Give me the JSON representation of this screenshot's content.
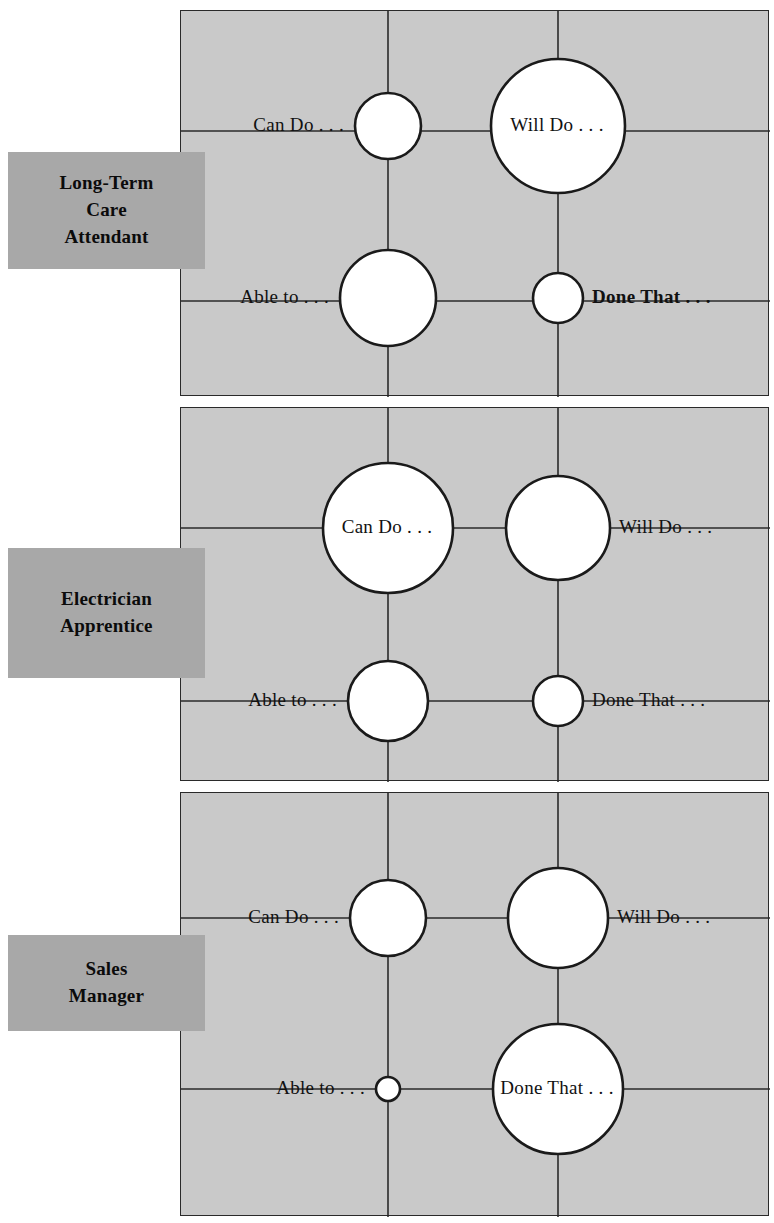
{
  "figure": {
    "type": "bubble-quadrant-grid",
    "background_color": "#ffffff",
    "panel_fill": "#c9c9c9",
    "panel_stroke": "#2a2a2a",
    "bubble_fill": "#ffffff",
    "bubble_stroke": "#1a1a1a",
    "role_box_fill": "#a8a8a8",
    "quadrant_labels": [
      "Can Do . . .",
      "Will Do . . .",
      "Able to . . .",
      "Done That . . ."
    ]
  },
  "panels": [
    {
      "role_label": "Long-Term\nCare\nAttendant",
      "role_box": {
        "x": 8,
        "y": 152,
        "w": 197,
        "h": 117
      },
      "frame": {
        "x": 180,
        "y": 10,
        "w": 589,
        "h": 386
      },
      "grid": {
        "vx": [
          387,
          557
        ],
        "hy": [
          130,
          300
        ]
      },
      "bubbles": [
        {
          "name": "can-do",
          "label": "Can Do . . .",
          "cx": 387,
          "cy": 125,
          "r": 33,
          "label_pos": "left",
          "label_inside": false,
          "bold": false
        },
        {
          "name": "will-do",
          "label": "Will Do . . .",
          "cx": 557,
          "cy": 125,
          "r": 67,
          "label_pos": "center",
          "label_inside": true,
          "bold": false
        },
        {
          "name": "able-to",
          "label": "Able to . . .",
          "cx": 387,
          "cy": 297,
          "r": 48,
          "label_pos": "left",
          "label_inside": false,
          "bold": false
        },
        {
          "name": "done-that",
          "label": "Done That . . .",
          "cx": 557,
          "cy": 297,
          "r": 25,
          "label_pos": "right",
          "label_inside": false,
          "bold": true
        }
      ]
    },
    {
      "role_label": "Electrician\nApprentice",
      "role_box": {
        "x": 8,
        "y": 548,
        "w": 197,
        "h": 130
      },
      "frame": {
        "x": 180,
        "y": 407,
        "w": 589,
        "h": 374
      },
      "grid": {
        "vx": [
          387,
          557
        ],
        "hy": [
          527,
          700
        ]
      },
      "bubbles": [
        {
          "name": "can-do",
          "label": "Can Do . . .",
          "cx": 387,
          "cy": 527,
          "r": 65,
          "label_pos": "center",
          "label_inside": true,
          "bold": false
        },
        {
          "name": "will-do",
          "label": "Will Do . . .",
          "cx": 557,
          "cy": 527,
          "r": 52,
          "label_pos": "right",
          "label_inside": false,
          "bold": false
        },
        {
          "name": "able-to",
          "label": "Able to . . .",
          "cx": 387,
          "cy": 700,
          "r": 40,
          "label_pos": "left",
          "label_inside": false,
          "bold": false
        },
        {
          "name": "done-that",
          "label": "Done That . . .",
          "cx": 557,
          "cy": 700,
          "r": 25,
          "label_pos": "right",
          "label_inside": false,
          "bold": false
        }
      ]
    },
    {
      "role_label": "Sales\nManager",
      "role_box": {
        "x": 8,
        "y": 935,
        "w": 197,
        "h": 96
      },
      "frame": {
        "x": 180,
        "y": 792,
        "w": 589,
        "h": 424
      },
      "grid": {
        "vx": [
          387,
          557
        ],
        "hy": [
          917,
          1088
        ]
      },
      "bubbles": [
        {
          "name": "can-do",
          "label": "Can Do . . .",
          "cx": 387,
          "cy": 917,
          "r": 38,
          "label_pos": "left",
          "label_inside": false,
          "bold": false
        },
        {
          "name": "will-do",
          "label": "Will Do . . .",
          "cx": 557,
          "cy": 917,
          "r": 50,
          "label_pos": "right",
          "label_inside": false,
          "bold": false
        },
        {
          "name": "able-to",
          "label": "Able to . . .",
          "cx": 387,
          "cy": 1088,
          "r": 12,
          "label_pos": "left",
          "label_inside": false,
          "bold": false
        },
        {
          "name": "done-that",
          "label": "Done That . . .",
          "cx": 557,
          "cy": 1088,
          "r": 65,
          "label_pos": "center",
          "label_inside": true,
          "bold": false
        }
      ]
    }
  ]
}
